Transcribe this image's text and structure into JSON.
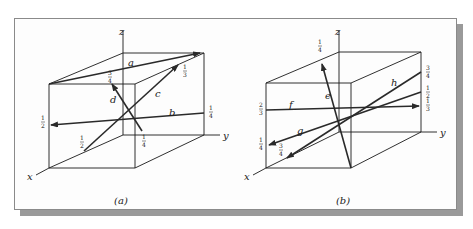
{
  "figure": {
    "panels": [
      {
        "id": "a",
        "caption": "(a)",
        "axes": {
          "x": "x",
          "y": "y",
          "z": "z"
        },
        "vectors": [
          {
            "name": "a",
            "label": "a"
          },
          {
            "name": "b",
            "label": "b",
            "start_fraction": "1/4",
            "end_fraction": "1/2"
          },
          {
            "name": "c",
            "label": "c",
            "start_fraction": "1/2",
            "end_fraction": "1/3"
          },
          {
            "name": "d",
            "label": "d",
            "start_fraction": "1/4",
            "end_fraction": "3/4"
          }
        ],
        "fractions": {
          "d_end": {
            "num": "3",
            "den": "4"
          },
          "c_end": {
            "num": "1",
            "den": "3"
          },
          "b_start": {
            "num": "1",
            "den": "4"
          },
          "b_end": {
            "num": "1",
            "den": "2"
          },
          "c_start": {
            "num": "1",
            "den": "2"
          },
          "d_start": {
            "num": "1",
            "den": "4"
          }
        }
      },
      {
        "id": "b",
        "caption": "(b)",
        "axes": {
          "x": "x",
          "y": "y",
          "z": "z"
        },
        "vectors": [
          {
            "name": "e",
            "label": "e"
          },
          {
            "name": "f",
            "label": "f"
          },
          {
            "name": "g",
            "label": "g"
          },
          {
            "name": "h",
            "label": "h"
          }
        ],
        "fractions": {
          "e_end": {
            "num": "1",
            "den": "4"
          },
          "h_start": {
            "num": "3",
            "den": "4"
          },
          "g_start": {
            "num": "1",
            "den": "2"
          },
          "f_end": {
            "num": "1",
            "den": "3"
          },
          "f_start": {
            "num": "2",
            "den": "3"
          },
          "g_end": {
            "num": "1",
            "den": "4"
          },
          "h_end": {
            "num": "3",
            "den": "4"
          }
        }
      }
    ]
  }
}
